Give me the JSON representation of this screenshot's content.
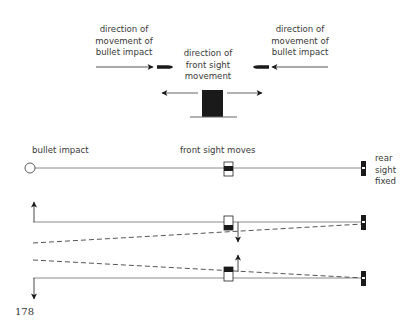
{
  "figure": {
    "top_panel": {
      "left_label": [
        "direction of",
        "movement of",
        "bullet impact"
      ],
      "center_label": [
        "direction of",
        "front sight",
        "movement"
      ],
      "right_label": [
        "direction of",
        "movement of",
        "bullet impact"
      ]
    },
    "bottom_panel": {
      "bullet_impact_label": "bullet impact",
      "front_sight_label": "front sight moves",
      "rear_sight_label": [
        "rear",
        "sight",
        "fixed"
      ]
    },
    "page_number": "178",
    "colors": {
      "line": "#8a8a8a",
      "ink": "#1a1a1a",
      "text": "#3a3a3a"
    }
  }
}
